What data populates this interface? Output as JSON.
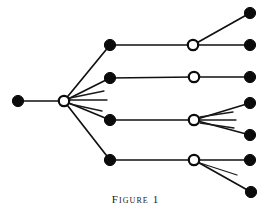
{
  "figure": {
    "caption": "Figure 1",
    "width": 271,
    "height": 217,
    "background_color": "#ffffff",
    "ink_color": "#0b0b0b"
  },
  "diagram_data": {
    "type": "tree-graph",
    "description": "Rooted branching tree diagram drawn left-to-right with alternating filled and open circular nodes connected by straight line segments, plus short unterminated stub rays fanning from two open nodes.",
    "node_styles": {
      "filled": {
        "name": "filled-circle",
        "fill": "#0b0b0b",
        "stroke": "#0b0b0b",
        "radius": 5.6
      },
      "open": {
        "name": "open-circle",
        "fill": "#ffffff",
        "stroke": "#0b0b0b",
        "radius": 5.2
      }
    },
    "nodes": [
      {
        "id": "n0",
        "label": "root-filled-node",
        "style": "filled",
        "x": 18,
        "y": 101,
        "level": 0
      },
      {
        "id": "n1",
        "label": "hub-open-node",
        "style": "open",
        "x": 64,
        "y": 101,
        "level": 1
      },
      {
        "id": "n2",
        "label": "branch-filled-node-1",
        "style": "filled",
        "x": 110,
        "y": 45,
        "level": 2
      },
      {
        "id": "n3",
        "label": "branch-filled-node-2",
        "style": "filled",
        "x": 110,
        "y": 78,
        "level": 2
      },
      {
        "id": "n4",
        "label": "branch-filled-node-3",
        "style": "filled",
        "x": 110,
        "y": 120,
        "level": 2
      },
      {
        "id": "n5",
        "label": "branch-filled-node-4",
        "style": "filled",
        "x": 110,
        "y": 160,
        "level": 2
      },
      {
        "id": "n6",
        "label": "junction-open-node-1",
        "style": "open",
        "x": 193,
        "y": 45,
        "level": 3
      },
      {
        "id": "n7",
        "label": "junction-open-node-2",
        "style": "open",
        "x": 194,
        "y": 77,
        "level": 3
      },
      {
        "id": "n8",
        "label": "junction-open-node-3",
        "style": "open",
        "x": 194,
        "y": 120,
        "level": 3
      },
      {
        "id": "n9",
        "label": "junction-open-node-4",
        "style": "open",
        "x": 194,
        "y": 160,
        "level": 3
      },
      {
        "id": "n10",
        "label": "leaf-filled-node-1",
        "style": "filled",
        "x": 250,
        "y": 13,
        "level": 4
      },
      {
        "id": "n11",
        "label": "leaf-filled-node-2",
        "style": "filled",
        "x": 250,
        "y": 45,
        "level": 4
      },
      {
        "id": "n12",
        "label": "leaf-filled-node-3",
        "style": "filled",
        "x": 250,
        "y": 77,
        "level": 4
      },
      {
        "id": "n13",
        "label": "leaf-filled-node-4",
        "style": "filled",
        "x": 250,
        "y": 103,
        "level": 4
      },
      {
        "id": "n14",
        "label": "leaf-filled-node-5",
        "style": "filled",
        "x": 250,
        "y": 135,
        "level": 4
      },
      {
        "id": "n15",
        "label": "leaf-filled-node-6",
        "style": "filled",
        "x": 250,
        "y": 160,
        "level": 4
      },
      {
        "id": "n16",
        "label": "leaf-filled-node-7",
        "style": "filled",
        "x": 251,
        "y": 192,
        "level": 4
      }
    ],
    "edges": [
      {
        "from": "n0",
        "to": "n1",
        "name": "edge-root-to-hub"
      },
      {
        "from": "n1",
        "to": "n2",
        "name": "edge-hub-to-branch-1"
      },
      {
        "from": "n1",
        "to": "n3",
        "name": "edge-hub-to-branch-2"
      },
      {
        "from": "n1",
        "to": "n4",
        "name": "edge-hub-to-branch-3"
      },
      {
        "from": "n1",
        "to": "n5",
        "name": "edge-hub-to-branch-4"
      },
      {
        "from": "n2",
        "to": "n6",
        "name": "edge-branch-1-to-junction-1"
      },
      {
        "from": "n3",
        "to": "n7",
        "name": "edge-branch-2-to-junction-2"
      },
      {
        "from": "n4",
        "to": "n8",
        "name": "edge-branch-3-to-junction-3"
      },
      {
        "from": "n5",
        "to": "n9",
        "name": "edge-branch-4-to-junction-4"
      },
      {
        "from": "n6",
        "to": "n10",
        "name": "edge-junction-1-to-leaf-1"
      },
      {
        "from": "n6",
        "to": "n11",
        "name": "edge-junction-1-to-leaf-2"
      },
      {
        "from": "n7",
        "to": "n12",
        "name": "edge-junction-2-to-leaf-3"
      },
      {
        "from": "n8",
        "to": "n13",
        "name": "edge-junction-3-to-leaf-4"
      },
      {
        "from": "n8",
        "to": "n14",
        "name": "edge-junction-3-to-leaf-5"
      },
      {
        "from": "n9",
        "to": "n15",
        "name": "edge-junction-4-to-leaf-6"
      },
      {
        "from": "n9",
        "to": "n16",
        "name": "edge-junction-4-to-leaf-7"
      }
    ],
    "stub_rays": [
      {
        "name": "hub-stub-ray-1",
        "from": "n1",
        "x1": 70,
        "y1": 98,
        "x2": 104,
        "y2": 91
      },
      {
        "name": "hub-stub-ray-2",
        "from": "n1",
        "x1": 70,
        "y1": 100,
        "x2": 107,
        "y2": 100
      },
      {
        "name": "hub-stub-ray-3",
        "from": "n1",
        "x1": 70,
        "y1": 104,
        "x2": 102,
        "y2": 111
      },
      {
        "name": "junction-3-stub-ray-1",
        "from": "n8",
        "x1": 200,
        "y1": 117,
        "x2": 233,
        "y2": 112
      },
      {
        "name": "junction-3-stub-ray-2",
        "from": "n8",
        "x1": 200,
        "y1": 120,
        "x2": 236,
        "y2": 120
      },
      {
        "name": "junction-3-stub-ray-3",
        "from": "n8",
        "x1": 200,
        "y1": 123,
        "x2": 234,
        "y2": 128
      },
      {
        "name": "junction-4-stub-ray-1",
        "from": "n9",
        "x1": 200,
        "y1": 163,
        "x2": 237,
        "y2": 175
      }
    ]
  }
}
